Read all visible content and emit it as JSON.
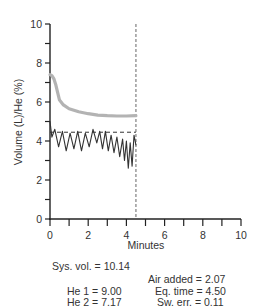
{
  "chart_data": {
    "type": "line",
    "title": "",
    "xlabel": "Minutes",
    "ylabel": "Volume (L)/He (%)",
    "xlim": [
      0,
      10
    ],
    "ylim": [
      0,
      10
    ],
    "x_ticks": [
      0,
      2,
      4,
      6,
      8,
      10
    ],
    "y_ticks": [
      0,
      2,
      4,
      6,
      8,
      10
    ],
    "grid": false,
    "series": [
      {
        "name": "He (%)",
        "color": "#b3b3b3",
        "style": "thick-solid",
        "x": [
          0.0,
          0.1,
          0.2,
          0.3,
          0.4,
          0.5,
          0.7,
          1.0,
          1.5,
          2.0,
          2.5,
          3.0,
          3.5,
          4.0,
          4.5
        ],
        "y": [
          7.4,
          7.35,
          7.2,
          6.9,
          6.5,
          6.1,
          5.85,
          5.65,
          5.5,
          5.4,
          5.33,
          5.3,
          5.28,
          5.28,
          5.3
        ]
      },
      {
        "name": "Volume (L)",
        "color": "#333333",
        "style": "zigzag",
        "x": [
          0.0,
          0.1,
          0.25,
          0.45,
          0.65,
          0.85,
          1.05,
          1.25,
          1.45,
          1.65,
          1.85,
          2.05,
          2.25,
          2.45,
          2.6,
          2.75,
          2.9,
          3.05,
          3.2,
          3.35,
          3.5,
          3.65,
          3.8,
          3.9,
          4.0,
          4.1,
          4.2,
          4.3,
          4.4,
          4.5
        ],
        "y": [
          5.0,
          4.2,
          4.6,
          3.7,
          4.5,
          3.5,
          4.4,
          3.6,
          4.5,
          3.5,
          4.4,
          3.7,
          4.6,
          3.9,
          4.5,
          3.6,
          4.5,
          3.5,
          4.3,
          3.4,
          4.2,
          3.2,
          4.1,
          3.0,
          4.0,
          2.6,
          3.9,
          2.7,
          4.3,
          3.8
        ]
      }
    ],
    "reference_lines": [
      {
        "orientation": "horizontal",
        "value": 4.45,
        "from_x": 0,
        "to_x": 4.5,
        "style": "dashed"
      },
      {
        "orientation": "vertical",
        "value": 4.5,
        "from_y": 0,
        "to_y": 10,
        "style": "dashed"
      }
    ]
  },
  "axes": {
    "ylabel": "Volume (L)/He (%)",
    "xlabel": "Minutes",
    "x_tick_labels": [
      "0",
      "2",
      "4",
      "6",
      "8",
      "10"
    ],
    "y_tick_labels": [
      "0",
      "2",
      "4",
      "6",
      "8",
      "10"
    ]
  },
  "stats": {
    "sys_vol": "Sys. vol. = 10.14",
    "air_added": "Air added = 2.07",
    "he1": "He 1 = 9.00",
    "eq_time": "Eq. time = 4.50",
    "he2": "He 2 = 7.17",
    "sw_err": "Sw. err. = 0.11"
  }
}
